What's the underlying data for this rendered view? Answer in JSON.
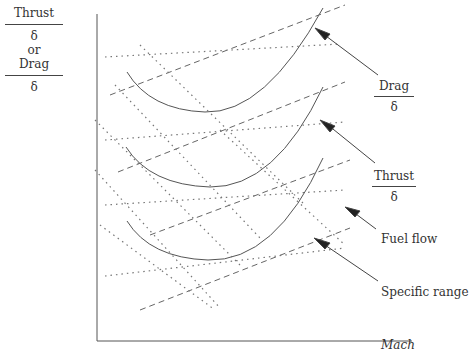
{
  "y_axis": {
    "numerator_top": "Thrust",
    "denominator_top": "δ",
    "or": "or",
    "numerator_bottom": "Drag",
    "denominator_bottom": "δ"
  },
  "x_axis": {
    "label": "Mach"
  },
  "labels": {
    "drag": {
      "numerator": "Drag",
      "denominator": "δ"
    },
    "thrust": {
      "numerator": "Thrust",
      "denominator": "δ"
    },
    "fuel_flow": "Fuel flow",
    "specific_range": "Specific range"
  },
  "legend_styles": {
    "drag": "solid",
    "thrust": "dashed",
    "fuel_flow": "dotted",
    "specific_range": "dotted"
  },
  "colors": {
    "lines": "#555555",
    "text": "#333333"
  }
}
